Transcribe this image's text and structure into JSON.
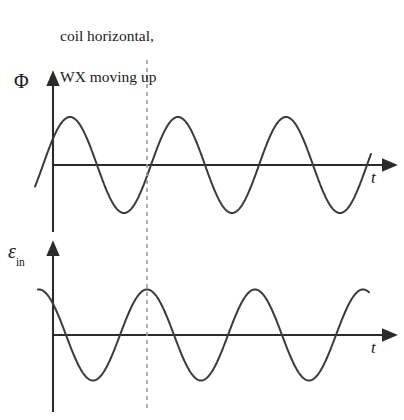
{
  "figure": {
    "width": 404,
    "height": 420,
    "background": "#ffffff",
    "stroke_color": "#3b3b3b",
    "axis_color": "#2b2b2b",
    "dashed_color": "#9a9a9a"
  },
  "caption": {
    "line1": "coil horizontal,",
    "line2": "WX moving up"
  },
  "axes": {
    "top": {
      "y_label": "Φ",
      "x_label": "t",
      "x_axis_y": 165,
      "y_axis_x": 53,
      "x_axis_start": 53,
      "x_axis_end": 390,
      "y_axis_top": 78,
      "y_axis_bottom": 232
    },
    "bottom": {
      "y_label": "ε",
      "y_label_sub": "in",
      "x_label": "t",
      "x_axis_y": 335,
      "y_axis_x": 53,
      "x_axis_start": 53,
      "x_axis_end": 390,
      "y_axis_top": 248,
      "y_axis_bottom": 412
    }
  },
  "marker": {
    "name": "dashed-time-marker",
    "x": 147,
    "y_start": 60,
    "y_end": 412,
    "dash": "4,4"
  },
  "chart_data": {
    "type": "line",
    "title": "coil horizontal, WX moving up",
    "xlabel": "t",
    "ylabel": "Φ (top), ε_in (bottom)",
    "grid": false,
    "legend": "none",
    "panels": [
      {
        "name": "magnetic-flux-waveform",
        "ylabel": "Φ",
        "xlabel": "t",
        "waveform": "cosine",
        "amplitude": 1.0,
        "period_px": 108,
        "phase_deg": 0,
        "zero_line_y": 165,
        "peak_y": 112,
        "trough_y": 208,
        "x_start": 35,
        "x_end": 371,
        "peaks_x": [
          70,
          178,
          286
        ],
        "troughs_x": [
          124,
          232,
          340
        ],
        "zero_crossings_x": [
          43,
          97,
          151,
          205,
          259,
          313,
          367
        ],
        "cycles_visible": 3,
        "value_at_marker": 0,
        "marker_slope": "rising"
      },
      {
        "name": "induced-emf-waveform",
        "ylabel": "ε_in",
        "xlabel": "t",
        "waveform": "sine (negative derivative of flux)",
        "amplitude": 1.0,
        "period_px": 108,
        "phase_shift_px": 27,
        "zero_line_y": 335,
        "peak_y": 290,
        "trough_y": 381,
        "x_start": 38,
        "x_end": 369,
        "peaks_x": [
          39,
          147,
          255,
          363
        ],
        "troughs_x": [
          93,
          201,
          309
        ],
        "zero_crossings_x": [
          66,
          120,
          174,
          228,
          282,
          336
        ],
        "cycles_visible": 3,
        "value_at_marker": 1.0,
        "marker_slope": "maximum"
      }
    ]
  }
}
